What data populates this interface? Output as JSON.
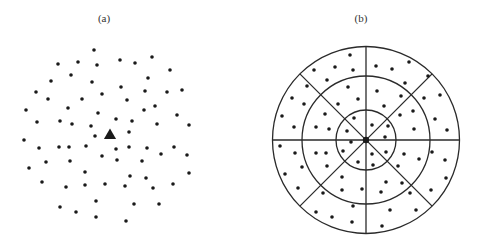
{
  "figure": {
    "colors": {
      "dot": "#1a1a1a",
      "line": "#2a2a2a",
      "background": "#ffffff"
    },
    "panel_a": {
      "label": "(a)",
      "label_pos": [
        104,
        22
      ],
      "marker": {
        "shape": "triangle",
        "center": [
          110,
          134
        ],
        "size": 11
      },
      "dot_radius": 1.8,
      "dots": [
        [
          94,
          50
        ],
        [
          58,
          64
        ],
        [
          78,
          62
        ],
        [
          97,
          65
        ],
        [
          120,
          60
        ],
        [
          135,
          63
        ],
        [
          152,
          57
        ],
        [
          170,
          70
        ],
        [
          71,
          75
        ],
        [
          51,
          81
        ],
        [
          92,
          82
        ],
        [
          148,
          78
        ],
        [
          36,
          92
        ],
        [
          121,
          87
        ],
        [
          145,
          91
        ],
        [
          167,
          92
        ],
        [
          182,
          90
        ],
        [
          48,
          99
        ],
        [
          82,
          99
        ],
        [
          102,
          94
        ],
        [
          127,
          100
        ],
        [
          26,
          110
        ],
        [
          68,
          108
        ],
        [
          98,
          113
        ],
        [
          144,
          110
        ],
        [
          155,
          106
        ],
        [
          177,
          115
        ],
        [
          37,
          122
        ],
        [
          60,
          121
        ],
        [
          72,
          124
        ],
        [
          91,
          126
        ],
        [
          116,
          119
        ],
        [
          132,
          121
        ],
        [
          157,
          124
        ],
        [
          189,
          125
        ],
        [
          95,
          136
        ],
        [
          129,
          132
        ],
        [
          24,
          140
        ],
        [
          39,
          148
        ],
        [
          59,
          147
        ],
        [
          69,
          147
        ],
        [
          86,
          146
        ],
        [
          116,
          149
        ],
        [
          129,
          147
        ],
        [
          147,
          148
        ],
        [
          174,
          147
        ],
        [
          161,
          154
        ],
        [
          187,
          155
        ],
        [
          102,
          156
        ],
        [
          46,
          162
        ],
        [
          70,
          161
        ],
        [
          117,
          160
        ],
        [
          142,
          161
        ],
        [
          29,
          168
        ],
        [
          85,
          172
        ],
        [
          130,
          176
        ],
        [
          146,
          178
        ],
        [
          189,
          173
        ],
        [
          42,
          182
        ],
        [
          85,
          185
        ],
        [
          66,
          187
        ],
        [
          105,
          184
        ],
        [
          125,
          186
        ],
        [
          153,
          188
        ],
        [
          173,
          184
        ],
        [
          96,
          201
        ],
        [
          60,
          207
        ],
        [
          134,
          204
        ],
        [
          159,
          204
        ],
        [
          76,
          212
        ],
        [
          96,
          217
        ],
        [
          126,
          221
        ]
      ]
    },
    "panel_b": {
      "label": "(b)",
      "label_pos": [
        361,
        22
      ],
      "center": [
        366,
        140
      ],
      "ring_radii": [
        30,
        64,
        93.5
      ],
      "sectors": 8,
      "center_dot_radius": 3.2,
      "dot_radius": 1.8,
      "dots": [
        [
          350,
          55
        ],
        [
          314,
          70
        ],
        [
          335,
          67
        ],
        [
          353,
          70
        ],
        [
          376,
          66
        ],
        [
          392,
          69
        ],
        [
          409,
          62
        ],
        [
          428,
          76
        ],
        [
          327,
          80
        ],
        [
          307,
          86
        ],
        [
          348,
          87
        ],
        [
          405,
          83
        ],
        [
          377,
          91
        ],
        [
          292,
          98
        ],
        [
          358,
          99
        ],
        [
          401,
          96
        ],
        [
          424,
          98
        ],
        [
          440,
          95
        ],
        [
          304,
          104
        ],
        [
          338,
          104
        ],
        [
          384,
          106
        ],
        [
          282,
          116
        ],
        [
          325,
          114
        ],
        [
          354,
          118
        ],
        [
          400,
          115
        ],
        [
          413,
          111
        ],
        [
          435,
          119
        ],
        [
          294,
          127
        ],
        [
          316,
          127
        ],
        [
          329,
          129
        ],
        [
          347,
          131
        ],
        [
          372,
          125
        ],
        [
          388,
          126
        ],
        [
          414,
          129
        ],
        [
          447,
          130
        ],
        [
          385,
          137
        ],
        [
          351,
          142
        ],
        [
          280,
          146
        ],
        [
          295,
          153
        ],
        [
          316,
          153
        ],
        [
          326,
          153
        ],
        [
          343,
          151
        ],
        [
          372,
          154
        ],
        [
          386,
          152
        ],
        [
          404,
          154
        ],
        [
          432,
          152
        ],
        [
          358,
          162
        ],
        [
          373,
          165
        ],
        [
          398,
          166
        ],
        [
          419,
          159
        ],
        [
          445,
          160
        ],
        [
          302,
          167
        ],
        [
          327,
          166
        ],
        [
          285,
          174
        ],
        [
          342,
          177
        ],
        [
          386,
          182
        ],
        [
          402,
          183
        ],
        [
          446,
          178
        ],
        [
          298,
          188
        ],
        [
          323,
          193
        ],
        [
          342,
          190
        ],
        [
          362,
          189
        ],
        [
          381,
          192
        ],
        [
          410,
          193
        ],
        [
          431,
          190
        ],
        [
          353,
          206
        ],
        [
          316,
          212
        ],
        [
          332,
          217
        ],
        [
          390,
          210
        ],
        [
          416,
          210
        ],
        [
          352,
          222
        ],
        [
          382,
          226
        ]
      ]
    }
  }
}
